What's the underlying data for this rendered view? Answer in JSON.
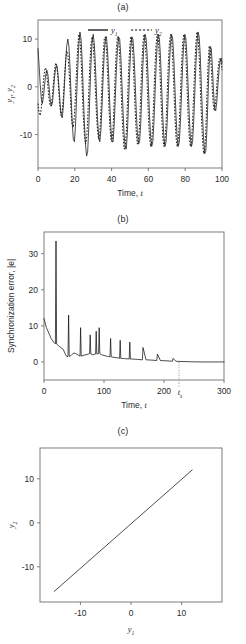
{
  "figure": {
    "panels": [
      "a",
      "b",
      "c"
    ]
  },
  "panel_a": {
    "title": "(a)",
    "xlabel_text": "Time,",
    "xlabel_italic": "t",
    "ylabel_y1": "y",
    "ylabel_y1_sub": "1",
    "ylabel_sep": ", ",
    "ylabel_y2": "y",
    "ylabel_y2_sub": "2",
    "legend": [
      {
        "name": "y",
        "sub": "1",
        "style": "solid"
      },
      {
        "name": "y",
        "sub": "2",
        "style": "dashed"
      }
    ],
    "xticks": [
      "0",
      "20",
      "40",
      "60",
      "80",
      "100"
    ],
    "yticks": [
      "10",
      "0",
      "-10"
    ]
  },
  "panel_b": {
    "title": "(b)",
    "xlabel_text": "Time,",
    "xlabel_italic": "t",
    "ylabel": "Synchronization error, |e|",
    "xticks": [
      "0",
      "100",
      "200",
      "300"
    ],
    "yticks": [
      "30",
      "20",
      "10",
      "0"
    ],
    "marker_label": "t",
    "marker_label_sub": "s"
  },
  "panel_c": {
    "title": "(c)",
    "xlabel": "y",
    "xlabel_sub": "1",
    "ylabel": "y",
    "ylabel_sub": "2",
    "xticks": [
      "-10",
      "0",
      "10"
    ],
    "yticks": [
      "10",
      "0",
      "-10"
    ]
  },
  "chart_data": [
    {
      "type": "line",
      "panel": "a",
      "title": "(a)",
      "xlabel": "Time, t",
      "ylabel": "y1, y2",
      "xlim": [
        0,
        100
      ],
      "ylim": [
        -17,
        14
      ],
      "xticks": [
        0,
        20,
        40,
        60,
        80,
        100
      ],
      "yticks": [
        -10,
        0,
        10
      ],
      "grid": false,
      "legend_position": "top-center",
      "series": [
        {
          "name": "y1",
          "style": "solid",
          "description": "Chaotic drive oscillator, irregular amplitude early then locked oscillation",
          "x": [
            0,
            0.6,
            1.2,
            1.8,
            2.4,
            3,
            3.6,
            4.2,
            4.8,
            5.4,
            6,
            6.6,
            7.2,
            7.8,
            8.4,
            9,
            9.6,
            10.2,
            10.8,
            11.4,
            12,
            12.6,
            13.2,
            13.8,
            14.4,
            15,
            15.6,
            16.2,
            16.8,
            17.4,
            18,
            18.6,
            19.2,
            19.8,
            20.4,
            21,
            21.6,
            22.2,
            22.8,
            23.4,
            24,
            24.6,
            25.2,
            25.8,
            26.4,
            27,
            27.6,
            28.2,
            28.8,
            29.4,
            30,
            30.6,
            31.2,
            31.8,
            32.4,
            33,
            33.6,
            34.2,
            34.8,
            35.4,
            36,
            36.6,
            37.2,
            37.8,
            38.4,
            39,
            39.6,
            40.2,
            40.8,
            41.4,
            42,
            42.6,
            43.2,
            43.8,
            44.4,
            45,
            45.6,
            46.2,
            46.8,
            47.4,
            48,
            48.6,
            49.2,
            49.8,
            50.4,
            51,
            51.6,
            52.2,
            52.8,
            53.4,
            54,
            54.6,
            55.2,
            55.8,
            56.4,
            57,
            57.6,
            58.2,
            58.8,
            59.4,
            60,
            60.6,
            61.2,
            61.8,
            62.4,
            63,
            63.6,
            64.2,
            64.8,
            65.4,
            66,
            66.6,
            67.2,
            67.8,
            68.4,
            69,
            69.6,
            70.2,
            70.8,
            71.4,
            72,
            72.6,
            73.2,
            73.8,
            74.4,
            75,
            75.6,
            76.2,
            76.8,
            77.4,
            78,
            78.6,
            79.2,
            79.8,
            80.4,
            81,
            81.6,
            82.2,
            82.8,
            83.4,
            84,
            84.6,
            85.2,
            85.8,
            86.4,
            87,
            87.6,
            88.2,
            88.8,
            89.4,
            90,
            90.6,
            91.2,
            91.8,
            92.4,
            93,
            93.6,
            94.2,
            94.8,
            95.4,
            96,
            96.6,
            97.2,
            97.8,
            98.4,
            99,
            99.6,
            100
          ],
          "y": [
            8,
            4.5,
            0.5,
            -2.5,
            -3.5,
            -2,
            0.5,
            2.5,
            3.5,
            2.5,
            0,
            -2.5,
            -4,
            -3.5,
            -1,
            2,
            4,
            4.5,
            3,
            0,
            -3.5,
            -6,
            -6.5,
            -4,
            0.5,
            5,
            8.5,
            10,
            8.5,
            4,
            -2,
            -7.5,
            -11,
            -11.5,
            -8,
            -2,
            4,
            9,
            11.5,
            10,
            5.5,
            -1,
            -7.5,
            -12,
            -14.5,
            -13.5,
            -8.5,
            -1.5,
            5,
            9.5,
            11,
            9,
            4.5,
            -1.5,
            -7,
            -10.5,
            -11.5,
            -9,
            -4,
            2,
            7,
            10,
            10.5,
            7.5,
            2.5,
            -3.5,
            -8.5,
            -11.5,
            -11.5,
            -8,
            -2.5,
            3.5,
            8,
            10.5,
            10,
            6.5,
            1,
            -5,
            -10,
            -13,
            -13,
            -9.5,
            -3.5,
            3,
            8,
            10.5,
            10,
            6.5,
            1,
            -5,
            -9.5,
            -12,
            -11.5,
            -8,
            -2,
            4.5,
            9,
            11,
            10,
            6,
            0,
            -6,
            -10.5,
            -12.5,
            -11.5,
            -7.5,
            -1.5,
            4.5,
            9,
            11,
            10,
            6,
            0,
            -6,
            -10.5,
            -12.5,
            -11.5,
            -7.5,
            -1.5,
            4.5,
            9,
            11,
            10,
            6,
            0,
            -6,
            -10.5,
            -12.5,
            -11.5,
            -7.5,
            -1.5,
            4.5,
            9,
            11,
            10,
            6,
            0,
            -6,
            -10.5,
            -12.5,
            -11.5,
            -7.5,
            -1.5,
            4.5,
            9,
            11.5,
            10.5,
            6.5,
            0,
            -6,
            -11,
            -14,
            -13.5,
            -9,
            -2,
            4.5,
            8.5,
            8,
            4,
            -1,
            -4.5,
            -5,
            -3,
            0.5,
            3.5,
            5.5,
            6,
            5,
            3.5,
            2,
            1,
            0.5,
            1
          ]
        },
        {
          "name": "y2",
          "style": "dashed",
          "description": "Chaotic response oscillator, initially desynchronized then converges onto y1",
          "x": [
            0,
            0.6,
            1.2,
            1.8,
            2.4,
            3,
            3.6,
            4.2,
            4.8,
            5.4,
            6,
            6.6,
            7.2,
            7.8,
            8.4,
            9,
            9.6,
            10.2,
            10.8,
            11.4,
            12,
            12.6,
            13.2,
            13.8,
            14.4,
            15,
            15.6,
            16.2,
            16.8,
            17.4,
            18,
            18.6,
            19.2,
            19.8,
            20.4,
            21,
            21.6,
            22.2,
            22.8,
            23.4,
            24,
            24.6,
            25.2,
            25.8,
            26.4,
            27,
            27.6,
            28.2,
            28.8,
            29.4,
            30,
            30.6,
            31.2,
            31.8,
            32.4,
            33,
            33.6,
            34.2,
            34.8,
            35.4,
            36,
            36.6,
            37.2,
            37.8,
            38.4,
            39,
            39.6,
            40.2,
            40.8,
            41.4,
            42,
            42.6,
            43.2,
            43.8,
            44.4,
            45,
            45.6,
            46.2,
            46.8,
            47.4,
            48,
            48.6,
            49.2,
            49.8,
            50.4,
            51,
            51.6,
            52.2,
            52.8,
            53.4,
            54,
            54.6,
            55.2,
            55.8,
            56.4,
            57,
            57.6,
            58.2,
            58.8,
            59.4,
            60,
            60.6,
            61.2,
            61.8,
            62.4,
            63,
            63.6,
            64.2,
            64.8,
            65.4,
            66,
            66.6,
            67.2,
            67.8,
            68.4,
            69,
            69.6,
            70.2,
            70.8,
            71.4,
            72,
            72.6,
            73.2,
            73.8,
            74.4,
            75,
            75.6,
            76.2,
            76.8,
            77.4,
            78,
            78.6,
            79.2,
            79.8,
            80.4,
            81,
            81.6,
            82.2,
            82.8,
            83.4,
            84,
            84.6,
            85.2,
            85.8,
            86.4,
            87,
            87.6,
            88.2,
            88.8,
            89.4,
            90,
            90.6,
            91.2,
            91.8,
            92.4,
            93,
            93.6,
            94.2,
            94.8,
            95.4,
            96,
            96.6,
            97.2,
            97.8,
            98.4,
            99,
            99.6,
            100
          ],
          "y": [
            -3.5,
            -5.5,
            -6,
            -4.5,
            -1.5,
            1.5,
            3.5,
            4,
            2.5,
            0,
            -2.5,
            -4,
            -4,
            -2,
            1,
            3.5,
            5,
            4.5,
            2,
            -1.5,
            -4.5,
            -6,
            -5,
            -2,
            2,
            5.5,
            7.5,
            7,
            4,
            -0.5,
            -5,
            -8,
            -8.5,
            -6,
            -1.5,
            4,
            8.5,
            11,
            10,
            6,
            0,
            -6,
            -10,
            -12,
            -11,
            -7,
            -1,
            5,
            9,
            10.5,
            9,
            5,
            -0.5,
            -6,
            -9.5,
            -11,
            -9.5,
            -5,
            1,
            6.5,
            10,
            10.5,
            8,
            3,
            -3,
            -8,
            -11,
            -11.5,
            -8.5,
            -3,
            3,
            8,
            10.5,
            10,
            6.5,
            1,
            -5,
            -10,
            -13,
            -13,
            -9.5,
            -3.5,
            3,
            8,
            10.5,
            10,
            6.5,
            1,
            -5,
            -9.5,
            -12,
            -11.5,
            -8,
            -2,
            4.5,
            9,
            11,
            10,
            6,
            0,
            -6,
            -10.5,
            -12.5,
            -11.5,
            -7.5,
            -1.5,
            4.5,
            9,
            11,
            10,
            6,
            0,
            -6,
            -10.5,
            -12.5,
            -11.5,
            -7.5,
            -1.5,
            4.5,
            9,
            11,
            10,
            6,
            0,
            -6,
            -10.5,
            -12.5,
            -11.5,
            -7.5,
            -1.5,
            4.5,
            9,
            11,
            10,
            6,
            0,
            -6,
            -10.5,
            -12.5,
            -11.5,
            -7.5,
            -1.5,
            4.5,
            9,
            11.5,
            10.5,
            6.5,
            0,
            -6,
            -11,
            -14,
            -13.5,
            -9,
            -2,
            4.5,
            8.5,
            8,
            4,
            -1,
            -4.5,
            -5,
            -3,
            0.5,
            3.5,
            5.5,
            6,
            5,
            3.5,
            2,
            1,
            0.5,
            1
          ]
        }
      ]
    },
    {
      "type": "line",
      "panel": "b",
      "title": "(b)",
      "xlabel": "Time, t",
      "ylabel": "Synchronization error, |e|",
      "xlim": [
        0,
        300
      ],
      "ylim": [
        -5,
        36
      ],
      "xticks": [
        0,
        100,
        200,
        300
      ],
      "yticks": [
        0,
        10,
        20,
        30
      ],
      "grid": false,
      "annotations": [
        {
          "label": "t_s",
          "x": 225,
          "type": "vertical-dotted-marker",
          "description": "settling time where synchronization error reaches zero"
        }
      ],
      "series": [
        {
          "name": "|e|",
          "style": "solid",
          "description": "Decaying synchronization error with transient spikes, reaching zero at t_s",
          "x": [
            0,
            4,
            8,
            12,
            16,
            19,
            20,
            21,
            24,
            28,
            32,
            36,
            38,
            40,
            41,
            42,
            43,
            46,
            50,
            54,
            58,
            60,
            61,
            62,
            65,
            70,
            74,
            76,
            77,
            78,
            81,
            84,
            86,
            87,
            88,
            91,
            92,
            93,
            96,
            100,
            104,
            108,
            110,
            111,
            112,
            115,
            120,
            124,
            126,
            127,
            128,
            132,
            136,
            140,
            142,
            143,
            144,
            148,
            152,
            156,
            160,
            163,
            164,
            165,
            170,
            175,
            180,
            185,
            187,
            188,
            189,
            194,
            200,
            205,
            210,
            213,
            214,
            215,
            220,
            225,
            235,
            245,
            255,
            265,
            275,
            285,
            295,
            300
          ],
          "y": [
            12,
            9.5,
            8,
            6.5,
            5.5,
            5,
            33.5,
            5,
            4.5,
            4,
            3.5,
            2,
            1.5,
            1.5,
            13,
            2,
            1.5,
            2,
            2.5,
            2.2,
            1.8,
            1.6,
            9.5,
            1.6,
            1.8,
            2,
            2.2,
            2.3,
            7.5,
            2.2,
            2,
            2.1,
            2.2,
            8.5,
            2.2,
            2.3,
            9.5,
            2.3,
            2,
            1.8,
            1.6,
            1.5,
            1.4,
            6.5,
            1.4,
            1.3,
            1.2,
            1.1,
            1,
            6,
            1,
            0.95,
            0.9,
            0.85,
            0.8,
            5.5,
            0.8,
            0.8,
            0.75,
            0.7,
            0.65,
            0.6,
            0.6,
            4,
            0.6,
            0.55,
            0.5,
            0.45,
            0.4,
            0.38,
            2.2,
            0.38,
            0.35,
            0.3,
            0.25,
            0.2,
            0.18,
            1,
            0.18,
            0.15,
            0.1,
            0.05,
            0.02,
            0,
            0,
            0,
            0,
            0,
            0
          ]
        }
      ]
    },
    {
      "type": "line",
      "panel": "c",
      "title": "(c)",
      "xlabel": "y1",
      "ylabel": "y2",
      "xlim": [
        -18,
        18
      ],
      "ylim": [
        -18,
        17
      ],
      "xticks": [
        -10,
        0,
        10
      ],
      "yticks": [
        -10,
        0,
        10
      ],
      "grid": false,
      "series": [
        {
          "name": "y2 vs y1",
          "style": "solid",
          "description": "Synchronization manifold: straight diagonal line y2 = y1",
          "x": [
            -15.2,
            12.1
          ],
          "y": [
            -15.6,
            12.0
          ]
        }
      ]
    }
  ]
}
